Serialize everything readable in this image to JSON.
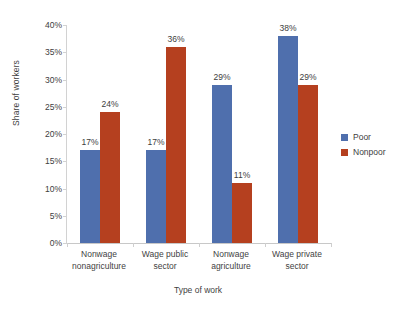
{
  "chart_data": {
    "type": "bar",
    "title": "",
    "xlabel": "Type of work",
    "ylabel": "Share of workers",
    "categories": [
      "Nonwage nonagriculture",
      "Wage public sector",
      "Nonwage agriculture",
      "Wage private sector"
    ],
    "category_lines": [
      [
        "Nonwage",
        "nonagriculture"
      ],
      [
        "Wage public",
        "sector"
      ],
      [
        "Nonwage",
        "agriculture"
      ],
      [
        "Wage private",
        "sector"
      ]
    ],
    "series": [
      {
        "name": "Poor",
        "color": "#4f6fad",
        "values": [
          17,
          17,
          29,
          38
        ],
        "labels": [
          "17%",
          "17%",
          "29%",
          "38%"
        ]
      },
      {
        "name": "Nonpoor",
        "color": "#b5401f",
        "values": [
          24,
          36,
          11,
          29
        ],
        "labels": [
          "24%",
          "36%",
          "11%",
          "29%"
        ]
      }
    ],
    "ylim": [
      0,
      40
    ],
    "ytick_values": [
      0,
      5,
      10,
      15,
      20,
      25,
      30,
      35,
      40
    ],
    "ytick_labels": [
      "0%",
      "5%",
      "10%",
      "15%",
      "20%",
      "25%",
      "30%",
      "35%",
      "40%"
    ],
    "grid": false,
    "legend_position": "right",
    "legend_entries": [
      "Poor",
      "Nonpoor"
    ]
  }
}
